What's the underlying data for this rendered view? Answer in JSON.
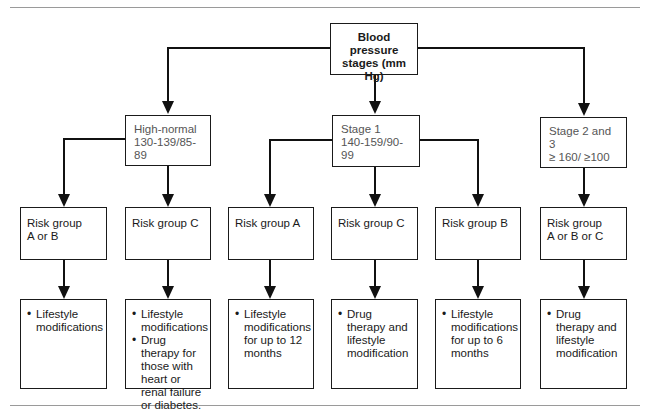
{
  "root": {
    "line1": "Blood pressure",
    "line2": "stages (mm Hg)"
  },
  "stages": [
    {
      "name": "High-normal",
      "range": "130-139/85-89"
    },
    {
      "name": "Stage 1",
      "range": "140-159/90-99"
    },
    {
      "name": "Stage 2 and 3",
      "range": "≥ 160/ ≥100"
    }
  ],
  "risk_groups": [
    {
      "line1": "Risk group",
      "line2": "A or B"
    },
    {
      "line1": "Risk group C",
      "line2": ""
    },
    {
      "line1": "Risk group A",
      "line2": ""
    },
    {
      "line1": "Risk group C",
      "line2": ""
    },
    {
      "line1": "Risk group B",
      "line2": ""
    },
    {
      "line1": "Risk group",
      "line2": "A or B or C"
    }
  ],
  "actions": [
    {
      "items": [
        "Lifestyle modifications"
      ]
    },
    {
      "items": [
        "Lifestyle modifications",
        "Drug therapy for those with heart or renal failure or diabetes."
      ]
    },
    {
      "items": [
        "Lifestyle modifications for up to 12 months"
      ]
    },
    {
      "items": [
        "Drug therapy and lifestyle modification"
      ]
    },
    {
      "items": [
        "Lifestyle modifications for up to 6 months"
      ]
    },
    {
      "items": [
        "Drug therapy and lifestyle modification"
      ]
    }
  ]
}
